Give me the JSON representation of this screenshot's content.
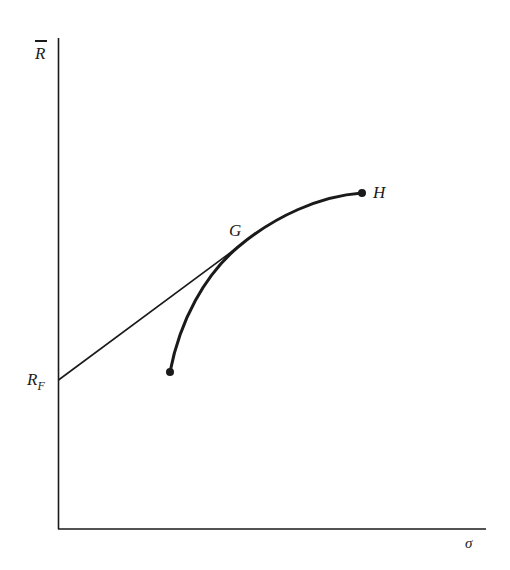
{
  "diagram": {
    "type": "efficient-frontier-with-riskless-lending",
    "axes": {
      "y_label": "R",
      "y_label_overbar": true,
      "x_label": "σ"
    },
    "points": {
      "risk_free": {
        "label": "R",
        "subscript": "F"
      },
      "tangency": {
        "label": "G"
      },
      "end": {
        "label": "H"
      }
    },
    "colors": {
      "ink": "#1a1a1a",
      "background": "#ffffff"
    }
  }
}
